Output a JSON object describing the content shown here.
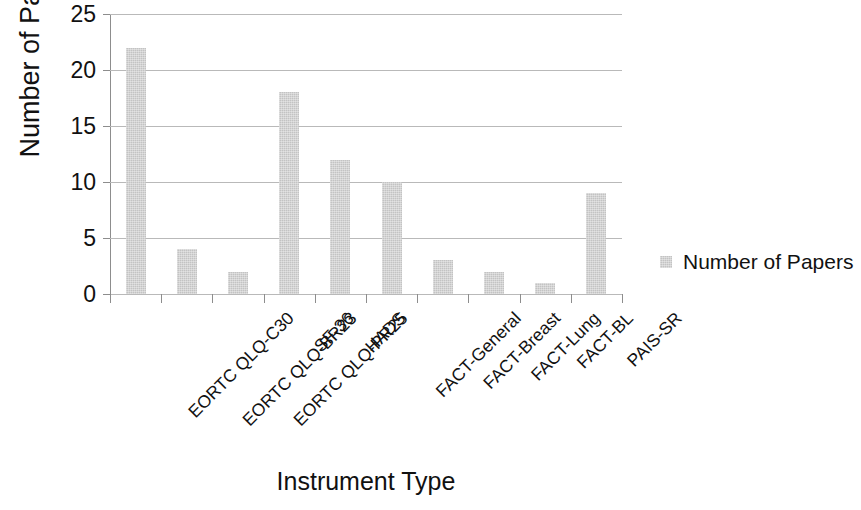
{
  "chart_data": {
    "type": "bar",
    "title": "",
    "xlabel": "Instrument Type",
    "ylabel": "Number of Papers",
    "categories": [
      "EORTC QLQ-C30",
      "EORTC QLQ-BR23",
      "EORTC QLQ-PR25",
      "SF-36",
      "HADS",
      "FACT-General",
      "FACT-Breast",
      "FACT-Lung",
      "FACT-BL",
      "PAIS-SR"
    ],
    "values": [
      22,
      4,
      2,
      18,
      12,
      10,
      3,
      2,
      1,
      9
    ],
    "series": [
      {
        "name": "Number of Papers",
        "values": [
          22,
          4,
          2,
          18,
          12,
          10,
          3,
          2,
          1,
          9
        ]
      }
    ],
    "ylim": [
      0,
      25
    ],
    "yticks": [
      0,
      5,
      10,
      15,
      20,
      25
    ],
    "ytick_labels": [
      "0",
      "5",
      "10",
      "15",
      "20",
      "25"
    ],
    "grid": true,
    "grid_axis": "y",
    "legend": {
      "position": "right",
      "entries": [
        {
          "label": "Number of Papers",
          "color": "#c3c3c3"
        }
      ]
    },
    "bar_color": "#c3c3c3",
    "axis_color": "#8d8d8d",
    "gridline_color": "#b9b9b9",
    "text_color": "#111111",
    "background": "#ffffff"
  }
}
